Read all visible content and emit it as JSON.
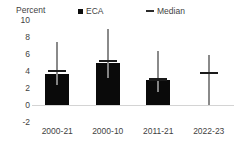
{
  "chart_data": {
    "type": "bar",
    "title": "",
    "subtitle": "",
    "xlabel": "",
    "ylabel": "Percent",
    "ylim": [
      -2,
      10
    ],
    "yticks": [
      10,
      8,
      6,
      4,
      2,
      0,
      -2
    ],
    "ytick_labels": [
      "10",
      "8",
      "6",
      "4",
      "2",
      "0",
      "-2"
    ],
    "grid": false,
    "legend_position": "top",
    "categories": [
      "2000-21",
      "2000-10",
      "2011-21",
      "2022-23"
    ],
    "series": [
      {
        "name": "ECA",
        "type": "bar",
        "color": "#0a0a0a",
        "values": [
          3.6,
          5.0,
          3.0,
          null
        ]
      },
      {
        "name": "Median",
        "type": "marker",
        "color": "#1a1a1a",
        "values": [
          4.0,
          5.2,
          3.0,
          3.8
        ]
      },
      {
        "name": "Range",
        "type": "errorbar",
        "color": "#808080",
        "low": [
          2.3,
          3.2,
          1.5,
          0.0
        ],
        "high": [
          7.4,
          9.0,
          6.4,
          5.9
        ]
      }
    ]
  },
  "legend": {
    "entries": [
      {
        "label": "ECA",
        "marker": "square-marker",
        "color": "#0d0d0d"
      },
      {
        "label": "Median",
        "marker": "dash-marker",
        "color": "#2b2b2b"
      }
    ]
  },
  "axis": {
    "y_title": "Percent"
  }
}
